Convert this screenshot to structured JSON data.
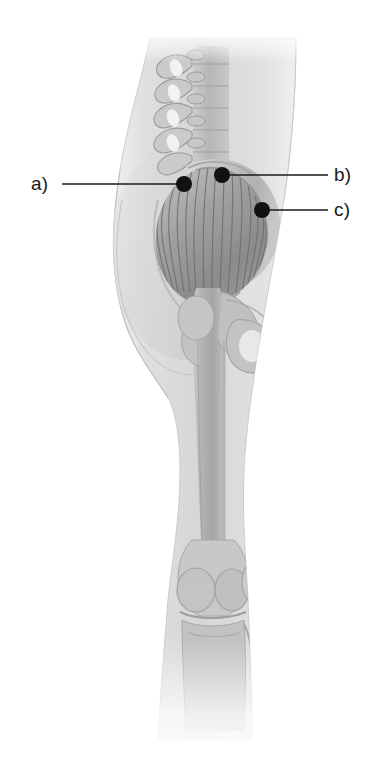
{
  "figure": {
    "background_color": "#ffffff",
    "width": 381,
    "height": 775,
    "style": "grayscale medical illustration"
  },
  "annotations": {
    "marker_color": "#111111",
    "leader_color": "#1a1a1a",
    "items": [
      {
        "id": "a",
        "label": "a)",
        "label_x": 31,
        "label_y": 174,
        "marker_x": 184,
        "marker_y": 184,
        "marker_radius": 8,
        "leader_from_x": 62,
        "leader_from_y": 184,
        "leader_to_x": 184,
        "leader_to_y": 184,
        "side": "left"
      },
      {
        "id": "b",
        "label": "b)",
        "label_x": 334,
        "label_y": 165,
        "marker_x": 222,
        "marker_y": 175,
        "marker_radius": 8,
        "leader_from_x": 328,
        "leader_from_y": 175,
        "leader_to_x": 222,
        "leader_to_y": 175,
        "side": "right"
      },
      {
        "id": "c",
        "label": "c)",
        "label_x": 334,
        "label_y": 200,
        "marker_x": 262,
        "marker_y": 210,
        "marker_radius": 8,
        "leader_from_x": 328,
        "leader_from_y": 210,
        "leader_to_x": 262,
        "leader_to_y": 210,
        "side": "right"
      }
    ]
  },
  "anatomy": {
    "palette": {
      "soft_tissue_light": "#e3e3e3",
      "soft_tissue_mid": "#d2d2d2",
      "soft_tissue_edge": "#c4c4c4",
      "bone_light": "#d8d8d8",
      "bone_mid": "#bdbdbd",
      "bone_dark": "#a2a2a2",
      "muscle_light": "#b5b5b5",
      "muscle_mid": "#959595",
      "muscle_dark": "#7a7a7a",
      "fiber_line": "#6f6f6f"
    },
    "structures": [
      {
        "name": "body-silhouette",
        "description": "posterior outline of buttock, thigh and lower leg"
      },
      {
        "name": "lumbar-spine",
        "description": "lumbar vertebrae with transverse processes"
      },
      {
        "name": "sacrum",
        "description": "sacral bone at base of spine"
      },
      {
        "name": "pelvis-ilium",
        "description": "iliac crest and pelvic bone"
      },
      {
        "name": "gluteus-maximus",
        "description": "fan-shaped gluteal muscle with radiating fibers"
      },
      {
        "name": "femur",
        "description": "thigh bone with greater trochanter and shaft"
      },
      {
        "name": "ischial-tuberosity",
        "description": "sit bone of pelvis"
      },
      {
        "name": "knee-joint",
        "description": "femoral condyles, patella and tibial plateau"
      },
      {
        "name": "tibia-fibula",
        "description": "lower leg bones"
      }
    ]
  }
}
